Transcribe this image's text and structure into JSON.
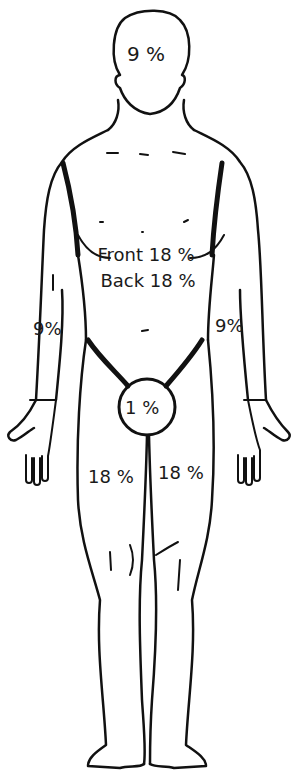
{
  "diagram": {
    "type": "rule-of-nines-body-chart",
    "view": "front",
    "line_color": "#111111",
    "background": "#ffffff"
  },
  "labels": {
    "head": "9 %",
    "torso_front": "Front 18 %",
    "torso_back": "Back 18 %",
    "arm_right": "9%",
    "arm_left": "9%",
    "perineum": "1 %",
    "leg_right": "18 %",
    "leg_left": "18 %"
  }
}
